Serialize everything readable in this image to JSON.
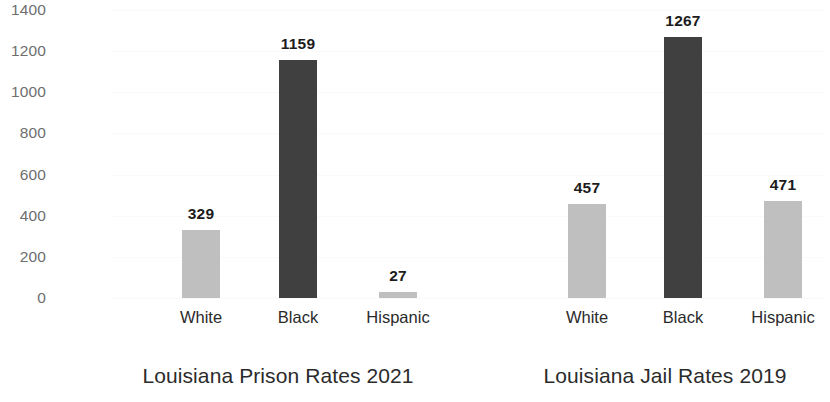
{
  "chart_data": [
    {
      "type": "bar",
      "title": "Louisiana Prison Rates 2021",
      "xlabel": "",
      "ylabel": "",
      "categories": [
        "White",
        "Black",
        "Hispanic"
      ],
      "values": [
        329,
        1159,
        27
      ],
      "bar_colors": [
        "#bfbfbf",
        "#404040",
        "#bfbfbf"
      ],
      "value_labels": [
        "329",
        "1159",
        "27"
      ],
      "ylim": [
        0,
        1400
      ],
      "yticks": [
        0,
        200,
        400,
        600,
        800,
        1000,
        1200,
        1400
      ],
      "ytick_labels": [
        "0",
        "200",
        "400",
        "600",
        "800",
        "1000",
        "1200",
        "1400"
      ],
      "grid": true,
      "legend": "none"
    },
    {
      "type": "bar",
      "title": "Louisiana Jail Rates 2019",
      "xlabel": "",
      "ylabel": "",
      "categories": [
        "White",
        "Black",
        "Hispanic"
      ],
      "values": [
        457,
        1267,
        471
      ],
      "bar_colors": [
        "#bfbfbf",
        "#404040",
        "#bfbfbf"
      ],
      "value_labels": [
        "457",
        "1267",
        "471"
      ],
      "ylim": [
        0,
        1400
      ],
      "yticks": [
        0,
        200,
        400,
        600,
        800,
        1000,
        1200,
        1400
      ],
      "ytick_labels": [
        "0",
        "200",
        "400",
        "600",
        "800",
        "1000",
        "1200",
        "1400"
      ],
      "grid": true,
      "legend": "none"
    }
  ],
  "axis": {
    "ytick_labels": [
      "1400",
      "1200",
      "1000",
      "800",
      "600",
      "400",
      "200",
      "0"
    ]
  },
  "colors": {
    "bar_light": "#bfbfbf",
    "bar_dark": "#404040",
    "tick_text": "#6e6e6e",
    "label_text": "#2b2b2b",
    "value_text": "#1c1c1c",
    "background": "#ffffff",
    "gridline": "#fafafa"
  }
}
